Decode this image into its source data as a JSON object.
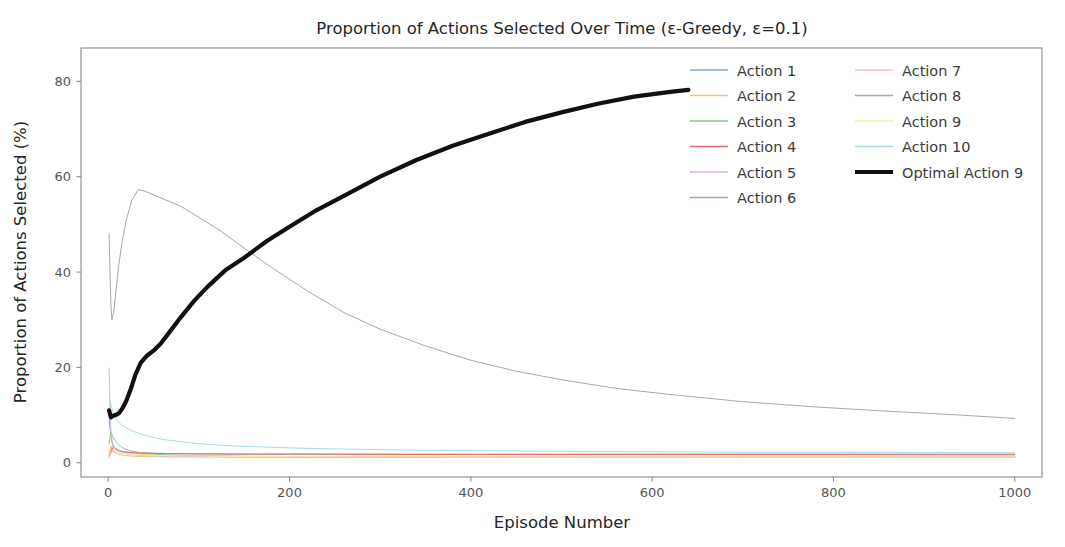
{
  "chart_data": {
    "type": "line",
    "title": "Proportion of Actions Selected Over Time (ε-Greedy, ε=0.1)",
    "xlabel": "Episode Number",
    "ylabel": "Proportion of Actions Selected (%)",
    "xlim": [
      -30,
      1030
    ],
    "ylim": [
      -3,
      87
    ],
    "xticks": [
      0,
      200,
      400,
      600,
      800,
      1000
    ],
    "xtick_labels": [
      "0",
      "200",
      "400",
      "600",
      "800",
      "1000"
    ],
    "yticks": [
      0,
      20,
      40,
      60,
      80
    ],
    "ytick_labels": [
      "0",
      "20",
      "40",
      "60",
      "80"
    ],
    "grid": false,
    "legend_position": "upper right",
    "legend_ncols": 2,
    "series": [
      {
        "name": "Action 1",
        "color": "#7ea6d8",
        "width": 1.0,
        "x": [
          1,
          3,
          5,
          8,
          12,
          18,
          25,
          35,
          50,
          70,
          100,
          150,
          200,
          300,
          400,
          500,
          600,
          700,
          800,
          900,
          1000
        ],
        "values": [
          9.0,
          5.5,
          3.6,
          3.0,
          2.6,
          2.3,
          2.2,
          2.1,
          2.0,
          1.9,
          1.85,
          1.8,
          1.8,
          1.8,
          1.8,
          1.8,
          1.8,
          1.8,
          1.8,
          1.8,
          1.8
        ]
      },
      {
        "name": "Action 2",
        "color": "#f2c27a",
        "width": 1.0,
        "x": [
          1,
          3,
          5,
          8,
          12,
          18,
          25,
          35,
          50,
          70,
          100,
          150,
          200,
          300,
          400,
          500,
          600,
          700,
          800,
          900,
          1000
        ],
        "values": [
          2.0,
          3.4,
          2.5,
          2.0,
          1.7,
          1.5,
          1.4,
          1.3,
          1.25,
          1.2,
          1.2,
          1.15,
          1.15,
          1.1,
          1.1,
          1.1,
          1.1,
          1.1,
          1.1,
          1.1,
          1.1
        ]
      },
      {
        "name": "Action 3",
        "color": "#8cc98c",
        "width": 1.0,
        "x": [
          1,
          3,
          5,
          8,
          12,
          18,
          25,
          35,
          50,
          70,
          100,
          150,
          200,
          300,
          400,
          500,
          600,
          700,
          800,
          900,
          1000
        ],
        "values": [
          4.0,
          6.5,
          5.5,
          4.5,
          3.6,
          2.9,
          2.5,
          2.1,
          1.8,
          1.6,
          1.45,
          1.35,
          1.3,
          1.25,
          1.2,
          1.2,
          1.2,
          1.2,
          1.2,
          1.2,
          1.2
        ]
      },
      {
        "name": "Action 4",
        "color": "#e8686e",
        "width": 1.0,
        "x": [
          1,
          3,
          5,
          8,
          12,
          18,
          25,
          35,
          50,
          70,
          100,
          150,
          200,
          300,
          400,
          500,
          600,
          700,
          800,
          900,
          1000
        ],
        "values": [
          1.5,
          2.2,
          3.1,
          2.8,
          2.4,
          2.2,
          2.1,
          2.0,
          1.95,
          1.9,
          1.85,
          1.8,
          1.8,
          1.75,
          1.7,
          1.7,
          1.7,
          1.7,
          1.7,
          1.65,
          1.65
        ]
      },
      {
        "name": "Action 5",
        "color": "#d9b6d9",
        "width": 1.0,
        "x": [
          1,
          2,
          3,
          5,
          8,
          12,
          18,
          25,
          35,
          50,
          70,
          100,
          150,
          200,
          300,
          400,
          500,
          600,
          700,
          800,
          900,
          1000
        ],
        "values": [
          19.8,
          12.0,
          6.5,
          4.0,
          3.0,
          2.4,
          2.0,
          1.8,
          1.6,
          1.45,
          1.35,
          1.3,
          1.25,
          1.2,
          1.15,
          1.15,
          1.1,
          1.1,
          1.1,
          1.1,
          1.1,
          1.1
        ]
      },
      {
        "name": "Action 6",
        "color": "#c59d8f",
        "width": 1.0,
        "x": [
          1,
          3,
          5,
          8,
          12,
          18,
          25,
          35,
          50,
          70,
          100,
          150,
          200,
          300,
          400,
          500,
          600,
          700,
          800,
          900,
          1000
        ],
        "values": [
          1.0,
          2.6,
          3.4,
          3.0,
          2.5,
          2.1,
          1.9,
          1.7,
          1.55,
          1.45,
          1.35,
          1.3,
          1.25,
          1.2,
          1.2,
          1.15,
          1.15,
          1.15,
          1.15,
          1.15,
          1.15
        ]
      },
      {
        "name": "Action 7",
        "color": "#f0c0d6",
        "width": 1.0,
        "x": [
          1,
          3,
          5,
          8,
          12,
          18,
          25,
          35,
          50,
          70,
          100,
          150,
          200,
          300,
          400,
          500,
          600,
          700,
          800,
          900,
          1000
        ],
        "values": [
          1.2,
          2.0,
          2.6,
          2.4,
          2.1,
          1.9,
          1.75,
          1.6,
          1.5,
          1.4,
          1.35,
          1.3,
          1.25,
          1.2,
          1.2,
          1.15,
          1.15,
          1.15,
          1.15,
          1.1,
          1.1
        ]
      },
      {
        "name": "Action 8",
        "color": "#a8a8a8",
        "width": 1.0,
        "x": [
          1,
          2,
          3,
          4,
          6,
          8,
          11,
          15,
          20,
          26,
          33,
          40,
          50,
          65,
          80,
          100,
          125,
          150,
          180,
          220,
          260,
          300,
          350,
          400,
          450,
          500,
          560,
          620,
          700,
          780,
          860,
          930,
          1000
        ],
        "values": [
          48.0,
          40.0,
          33.0,
          30.0,
          31.5,
          35.0,
          40.5,
          46.0,
          51.0,
          55.0,
          57.3,
          57.0,
          56.2,
          55.0,
          53.8,
          51.5,
          48.5,
          45.0,
          41.0,
          36.0,
          31.5,
          28.0,
          24.5,
          21.5,
          19.2,
          17.4,
          15.6,
          14.3,
          12.8,
          11.7,
          10.8,
          10.1,
          9.3
        ]
      },
      {
        "name": "Action 9",
        "color": "#f5ef9a",
        "width": 1.0,
        "x": [
          1,
          3,
          5,
          8,
          12,
          18,
          25,
          35,
          50,
          70,
          100,
          150,
          200,
          300,
          400,
          500,
          600,
          700,
          800,
          900,
          1000
        ],
        "values": [
          2.5,
          3.8,
          3.2,
          2.7,
          2.3,
          2.0,
          1.85,
          1.7,
          1.55,
          1.45,
          1.4,
          1.3,
          1.28,
          1.25,
          1.2,
          1.2,
          1.2,
          1.2,
          1.2,
          1.2,
          1.2
        ]
      },
      {
        "name": "Action 10",
        "color": "#a8dce8",
        "width": 1.0,
        "x": [
          1,
          2,
          4,
          6,
          9,
          13,
          18,
          25,
          33,
          45,
          60,
          80,
          100,
          130,
          170,
          220,
          280,
          350,
          420,
          500,
          600,
          700,
          800,
          900,
          1000
        ],
        "values": [
          10.0,
          13.2,
          11.5,
          10.0,
          9.0,
          8.2,
          7.5,
          6.8,
          6.2,
          5.5,
          4.9,
          4.4,
          4.0,
          3.6,
          3.3,
          3.0,
          2.8,
          2.6,
          2.5,
          2.4,
          2.3,
          2.2,
          2.2,
          2.15,
          2.1
        ]
      },
      {
        "name": "Optimal Action 9",
        "color": "#111111",
        "width": 4.2,
        "x": [
          1,
          3,
          5,
          8,
          12,
          16,
          20,
          25,
          30,
          36,
          43,
          50,
          58,
          68,
          80,
          95,
          110,
          130,
          150,
          175,
          200,
          230,
          260,
          300,
          340,
          380,
          420,
          460,
          500,
          540,
          580,
          620,
          640
        ],
        "values": [
          11.0,
          9.5,
          9.8,
          10.0,
          10.4,
          11.5,
          13.0,
          15.5,
          18.5,
          21.0,
          22.5,
          23.5,
          25.0,
          27.5,
          30.5,
          34.0,
          37.0,
          40.5,
          43.0,
          46.5,
          49.5,
          53.0,
          56.0,
          60.0,
          63.5,
          66.5,
          69.0,
          71.5,
          73.5,
          75.3,
          76.8,
          77.8,
          78.2
        ]
      }
    ],
    "legend_columns": [
      [
        "Action 1",
        "Action 2",
        "Action 3",
        "Action 4",
        "Action 5",
        "Action 6"
      ],
      [
        "Action 7",
        "Action 8",
        "Action 9",
        "Action 10",
        "Optimal Action 9"
      ]
    ]
  }
}
